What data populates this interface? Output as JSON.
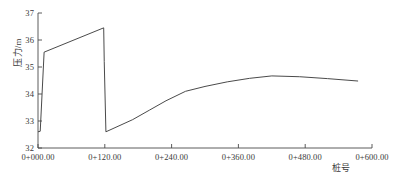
{
  "chart_data": {
    "type": "line",
    "title": "",
    "subtitle": "",
    "xlabel": "桩号",
    "ylabel": "压力/m",
    "xlim": [
      0,
      600
    ],
    "ylim": [
      32,
      37
    ],
    "grid": false,
    "legend": null,
    "legend_position": "none",
    "x_tick_labels": [
      "0+000.00",
      "0+120.00",
      "0+240.00",
      "0+360.00",
      "0+480.00",
      "0+600.00"
    ],
    "x_tick_values": [
      0,
      120,
      240,
      360,
      480,
      600
    ],
    "y_tick_labels": [
      "32",
      "33",
      "34",
      "35",
      "36",
      "37"
    ],
    "y_tick_values": [
      32,
      33,
      34,
      35,
      36,
      37
    ],
    "series": [
      {
        "name": "压力",
        "color": "#404040",
        "x": [
          0,
          4,
          11,
          118,
          119,
          122,
          170,
          200,
          230,
          265,
          300,
          340,
          380,
          420,
          470,
          520,
          575
        ],
        "values": [
          32.6,
          32.62,
          35.55,
          36.45,
          35.2,
          32.6,
          33.05,
          33.4,
          33.75,
          34.1,
          34.28,
          34.45,
          34.58,
          34.67,
          34.64,
          34.57,
          34.48
        ]
      }
    ],
    "annotations": []
  },
  "axis": {
    "x_axis_name": "x-axis",
    "y_axis_name": "y-axis"
  }
}
